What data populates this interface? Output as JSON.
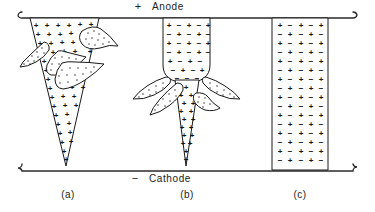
{
  "figure": {
    "background_color": "#ffffff",
    "ink_color": "#1a1a1a",
    "width": 375,
    "height": 212
  },
  "electrodes": {
    "anode": {
      "polarity_sign": "+",
      "label": "Anode",
      "y": 17,
      "x_start": 18,
      "x_end": 357
    },
    "cathode": {
      "polarity_sign": "−",
      "label": "Cathode",
      "y": 170,
      "x_start": 18,
      "x_end": 357
    }
  },
  "panels": [
    {
      "id": "a",
      "caption": "(a)",
      "caption_x": 68,
      "caption_y": 196,
      "description": "Wide tapering cone of positive charge from anode narrowing to a point at the cathode, with three stippled teardrop lobes branching outward",
      "charge_symbol": "+",
      "lobe_count": 3
    },
    {
      "id": "b",
      "caption": "(b)",
      "caption_x": 187,
      "caption_y": 196,
      "description": "Rounded-bottom column of mixed positive and negative charge near the anode, four stippled lobes at the neck, and a narrow positive cone continuing to the cathode",
      "charge_symbol_upper": "+ −",
      "charge_symbol_lower": "+",
      "lobe_count": 4
    },
    {
      "id": "c",
      "caption": "(c)",
      "caption_x": 300,
      "caption_y": 196,
      "description": "Straight parallel-sided column spanning anode to cathode filled with an alternating checkerboard of positive and negative charges",
      "charge_symbols": "+ −",
      "lobe_count": 0
    }
  ],
  "charge_symbols": {
    "positive": "+",
    "negative": "−"
  },
  "panel_a": {
    "charges": [
      {
        "x": 36,
        "y": 25,
        "s": "+"
      },
      {
        "x": 47,
        "y": 25,
        "s": "+"
      },
      {
        "x": 58,
        "y": 25,
        "s": "+"
      },
      {
        "x": 69,
        "y": 25,
        "s": "+"
      },
      {
        "x": 80,
        "y": 24,
        "s": "+"
      },
      {
        "x": 91,
        "y": 24,
        "s": "+"
      },
      {
        "x": 38,
        "y": 34,
        "s": "+"
      },
      {
        "x": 49,
        "y": 34,
        "s": "+"
      },
      {
        "x": 60,
        "y": 34,
        "s": "+"
      },
      {
        "x": 71,
        "y": 33,
        "s": "+"
      },
      {
        "x": 82,
        "y": 33,
        "s": "+"
      },
      {
        "x": 40,
        "y": 43,
        "s": "+"
      },
      {
        "x": 51,
        "y": 43,
        "s": "+"
      },
      {
        "x": 62,
        "y": 42,
        "s": "+"
      },
      {
        "x": 73,
        "y": 42,
        "s": "+"
      },
      {
        "x": 88,
        "y": 42,
        "s": "+"
      },
      {
        "x": 53,
        "y": 52,
        "s": "+"
      },
      {
        "x": 64,
        "y": 51,
        "s": "+"
      },
      {
        "x": 75,
        "y": 51,
        "s": "+"
      },
      {
        "x": 90,
        "y": 51,
        "s": "+"
      },
      {
        "x": 44,
        "y": 61,
        "s": "+"
      },
      {
        "x": 55,
        "y": 60,
        "s": "+"
      },
      {
        "x": 66,
        "y": 60,
        "s": "+"
      },
      {
        "x": 77,
        "y": 60,
        "s": "+"
      },
      {
        "x": 46,
        "y": 70,
        "s": "+"
      },
      {
        "x": 57,
        "y": 69,
        "s": "+"
      },
      {
        "x": 68,
        "y": 69,
        "s": "+"
      },
      {
        "x": 79,
        "y": 69,
        "s": "+"
      },
      {
        "x": 48,
        "y": 79,
        "s": "+"
      },
      {
        "x": 59,
        "y": 78,
        "s": "+"
      },
      {
        "x": 70,
        "y": 78,
        "s": "+"
      },
      {
        "x": 50,
        "y": 88,
        "s": "+"
      },
      {
        "x": 61,
        "y": 87,
        "s": "+"
      },
      {
        "x": 72,
        "y": 87,
        "s": "+"
      },
      {
        "x": 83,
        "y": 87,
        "s": "+"
      },
      {
        "x": 52,
        "y": 97,
        "s": "+"
      },
      {
        "x": 63,
        "y": 96,
        "s": "+"
      },
      {
        "x": 74,
        "y": 96,
        "s": "+"
      },
      {
        "x": 54,
        "y": 106,
        "s": "+"
      },
      {
        "x": 65,
        "y": 105,
        "s": "+"
      },
      {
        "x": 76,
        "y": 105,
        "s": "+"
      },
      {
        "x": 56,
        "y": 115,
        "s": "+"
      },
      {
        "x": 67,
        "y": 114,
        "s": "+"
      },
      {
        "x": 58,
        "y": 124,
        "s": "+"
      },
      {
        "x": 69,
        "y": 123,
        "s": "+"
      },
      {
        "x": 60,
        "y": 133,
        "s": "+"
      },
      {
        "x": 70,
        "y": 132,
        "s": "+"
      },
      {
        "x": 62,
        "y": 142,
        "s": "+"
      },
      {
        "x": 71,
        "y": 141,
        "s": "+"
      },
      {
        "x": 64,
        "y": 151,
        "s": "+"
      },
      {
        "x": 66,
        "y": 159,
        "s": "+"
      }
    ]
  },
  "panel_b": {
    "charges_upper": [
      {
        "x": 169,
        "y": 25,
        "s": "+"
      },
      {
        "x": 179,
        "y": 25,
        "s": "−"
      },
      {
        "x": 189,
        "y": 25,
        "s": "+"
      },
      {
        "x": 199,
        "y": 25,
        "s": "−"
      },
      {
        "x": 209,
        "y": 25,
        "s": "+"
      },
      {
        "x": 169,
        "y": 34,
        "s": "−"
      },
      {
        "x": 179,
        "y": 34,
        "s": "+"
      },
      {
        "x": 189,
        "y": 34,
        "s": "−"
      },
      {
        "x": 199,
        "y": 34,
        "s": "+"
      },
      {
        "x": 209,
        "y": 34,
        "s": "−"
      },
      {
        "x": 169,
        "y": 43,
        "s": "+"
      },
      {
        "x": 179,
        "y": 43,
        "s": "−"
      },
      {
        "x": 189,
        "y": 43,
        "s": "+"
      },
      {
        "x": 199,
        "y": 43,
        "s": "−"
      },
      {
        "x": 209,
        "y": 43,
        "s": "+"
      },
      {
        "x": 169,
        "y": 52,
        "s": "−"
      },
      {
        "x": 179,
        "y": 52,
        "s": "+"
      },
      {
        "x": 189,
        "y": 52,
        "s": "−"
      },
      {
        "x": 199,
        "y": 52,
        "s": "+"
      },
      {
        "x": 209,
        "y": 52,
        "s": "−"
      },
      {
        "x": 169,
        "y": 61,
        "s": "+"
      },
      {
        "x": 179,
        "y": 61,
        "s": "−"
      },
      {
        "x": 189,
        "y": 61,
        "s": "+"
      },
      {
        "x": 199,
        "y": 61,
        "s": "−"
      },
      {
        "x": 207,
        "y": 61,
        "s": "+"
      },
      {
        "x": 172,
        "y": 70,
        "s": "−"
      },
      {
        "x": 182,
        "y": 70,
        "s": "+"
      },
      {
        "x": 192,
        "y": 70,
        "s": "−"
      },
      {
        "x": 202,
        "y": 70,
        "s": "+"
      },
      {
        "x": 176,
        "y": 77,
        "s": "−"
      },
      {
        "x": 186,
        "y": 77,
        "s": "−"
      },
      {
        "x": 196,
        "y": 77,
        "s": "−"
      }
    ],
    "charges_lower": [
      {
        "x": 186,
        "y": 86,
        "s": "+"
      },
      {
        "x": 181,
        "y": 95,
        "s": "+"
      },
      {
        "x": 191,
        "y": 95,
        "s": "+"
      },
      {
        "x": 184,
        "y": 104,
        "s": "+"
      },
      {
        "x": 194,
        "y": 104,
        "s": "+"
      },
      {
        "x": 181,
        "y": 112,
        "s": "+"
      },
      {
        "x": 191,
        "y": 112,
        "s": "+"
      },
      {
        "x": 184,
        "y": 120,
        "s": "+"
      },
      {
        "x": 193,
        "y": 120,
        "s": "+"
      },
      {
        "x": 181,
        "y": 128,
        "s": "+"
      },
      {
        "x": 190,
        "y": 128,
        "s": "+"
      },
      {
        "x": 184,
        "y": 136,
        "s": "+"
      },
      {
        "x": 192,
        "y": 136,
        "s": "+"
      },
      {
        "x": 183,
        "y": 144,
        "s": "+"
      },
      {
        "x": 190,
        "y": 144,
        "s": "+"
      },
      {
        "x": 185,
        "y": 152,
        "s": "+"
      },
      {
        "x": 186,
        "y": 160,
        "s": "+"
      }
    ]
  },
  "panel_c": {
    "charges": [
      {
        "x": 280,
        "y": 25,
        "s": "+"
      },
      {
        "x": 290,
        "y": 25,
        "s": "−"
      },
      {
        "x": 301,
        "y": 25,
        "s": "+"
      },
      {
        "x": 311,
        "y": 25,
        "s": "−"
      },
      {
        "x": 321,
        "y": 25,
        "s": "+"
      },
      {
        "x": 280,
        "y": 34,
        "s": "−"
      },
      {
        "x": 290,
        "y": 34,
        "s": "+"
      },
      {
        "x": 301,
        "y": 34,
        "s": "−"
      },
      {
        "x": 311,
        "y": 34,
        "s": "+"
      },
      {
        "x": 321,
        "y": 34,
        "s": "−"
      },
      {
        "x": 280,
        "y": 43,
        "s": "+"
      },
      {
        "x": 290,
        "y": 43,
        "s": "−"
      },
      {
        "x": 301,
        "y": 43,
        "s": "+"
      },
      {
        "x": 311,
        "y": 43,
        "s": "−"
      },
      {
        "x": 321,
        "y": 43,
        "s": "+"
      },
      {
        "x": 280,
        "y": 52,
        "s": "−"
      },
      {
        "x": 290,
        "y": 52,
        "s": "+"
      },
      {
        "x": 301,
        "y": 52,
        "s": "−"
      },
      {
        "x": 311,
        "y": 52,
        "s": "+"
      },
      {
        "x": 321,
        "y": 52,
        "s": "−"
      },
      {
        "x": 280,
        "y": 61,
        "s": "+"
      },
      {
        "x": 290,
        "y": 61,
        "s": "−"
      },
      {
        "x": 301,
        "y": 61,
        "s": "+"
      },
      {
        "x": 311,
        "y": 61,
        "s": "−"
      },
      {
        "x": 321,
        "y": 61,
        "s": "+"
      },
      {
        "x": 280,
        "y": 70,
        "s": "−"
      },
      {
        "x": 290,
        "y": 70,
        "s": "+"
      },
      {
        "x": 301,
        "y": 70,
        "s": "−"
      },
      {
        "x": 311,
        "y": 70,
        "s": "+"
      },
      {
        "x": 321,
        "y": 70,
        "s": "−"
      },
      {
        "x": 280,
        "y": 79,
        "s": "+"
      },
      {
        "x": 290,
        "y": 79,
        "s": "−"
      },
      {
        "x": 301,
        "y": 79,
        "s": "+"
      },
      {
        "x": 311,
        "y": 79,
        "s": "−"
      },
      {
        "x": 321,
        "y": 79,
        "s": "+"
      },
      {
        "x": 280,
        "y": 88,
        "s": "−"
      },
      {
        "x": 290,
        "y": 88,
        "s": "+"
      },
      {
        "x": 301,
        "y": 88,
        "s": "−"
      },
      {
        "x": 311,
        "y": 88,
        "s": "+"
      },
      {
        "x": 321,
        "y": 88,
        "s": "−"
      },
      {
        "x": 280,
        "y": 97,
        "s": "+"
      },
      {
        "x": 290,
        "y": 97,
        "s": "−"
      },
      {
        "x": 301,
        "y": 97,
        "s": "+"
      },
      {
        "x": 311,
        "y": 97,
        "s": "−"
      },
      {
        "x": 321,
        "y": 97,
        "s": "+"
      },
      {
        "x": 280,
        "y": 106,
        "s": "−"
      },
      {
        "x": 290,
        "y": 106,
        "s": "+"
      },
      {
        "x": 301,
        "y": 106,
        "s": "−"
      },
      {
        "x": 311,
        "y": 106,
        "s": "+"
      },
      {
        "x": 321,
        "y": 106,
        "s": "−"
      },
      {
        "x": 280,
        "y": 115,
        "s": "+"
      },
      {
        "x": 290,
        "y": 115,
        "s": "−"
      },
      {
        "x": 301,
        "y": 115,
        "s": "+"
      },
      {
        "x": 311,
        "y": 115,
        "s": "−"
      },
      {
        "x": 321,
        "y": 115,
        "s": "+"
      },
      {
        "x": 280,
        "y": 124,
        "s": "−"
      },
      {
        "x": 290,
        "y": 124,
        "s": "+"
      },
      {
        "x": 301,
        "y": 124,
        "s": "−"
      },
      {
        "x": 311,
        "y": 124,
        "s": "+"
      },
      {
        "x": 321,
        "y": 124,
        "s": "−"
      },
      {
        "x": 280,
        "y": 133,
        "s": "+"
      },
      {
        "x": 290,
        "y": 133,
        "s": "−"
      },
      {
        "x": 301,
        "y": 133,
        "s": "+"
      },
      {
        "x": 311,
        "y": 133,
        "s": "−"
      },
      {
        "x": 321,
        "y": 133,
        "s": "+"
      },
      {
        "x": 280,
        "y": 142,
        "s": "−"
      },
      {
        "x": 290,
        "y": 142,
        "s": "+"
      },
      {
        "x": 301,
        "y": 142,
        "s": "−"
      },
      {
        "x": 311,
        "y": 142,
        "s": "+"
      },
      {
        "x": 321,
        "y": 142,
        "s": "−"
      },
      {
        "x": 280,
        "y": 151,
        "s": "+"
      },
      {
        "x": 290,
        "y": 151,
        "s": "−"
      },
      {
        "x": 301,
        "y": 151,
        "s": "+"
      },
      {
        "x": 311,
        "y": 151,
        "s": "−"
      },
      {
        "x": 321,
        "y": 151,
        "s": "+"
      },
      {
        "x": 280,
        "y": 160,
        "s": "−"
      },
      {
        "x": 290,
        "y": 160,
        "s": "+"
      },
      {
        "x": 301,
        "y": 160,
        "s": "−"
      },
      {
        "x": 311,
        "y": 160,
        "s": "+"
      },
      {
        "x": 321,
        "y": 160,
        "s": "−"
      }
    ]
  }
}
